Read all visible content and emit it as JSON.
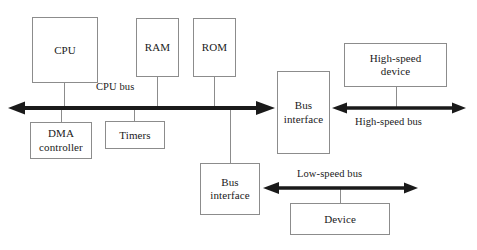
{
  "diagram": {
    "stroke_color": "#8c8c8c",
    "bus_color": "#1a1a1a",
    "text_color": "#1a1a1a",
    "background": "#ffffff"
  },
  "blocks": {
    "cpu": {
      "label": "CPU"
    },
    "ram": {
      "label": "RAM"
    },
    "rom": {
      "label": "ROM"
    },
    "dma_controller": {
      "label": "DMA\ncontroller"
    },
    "timers": {
      "label": "Timers"
    },
    "bus_interface_high": {
      "label": "Bus\ninterface"
    },
    "bus_interface_low": {
      "label": "Bus\ninterface"
    },
    "high_speed_device": {
      "label": "High-speed\ndevice"
    },
    "device": {
      "label": "Device"
    }
  },
  "buses": {
    "cpu_bus": {
      "label": "CPU bus"
    },
    "high_speed_bus": {
      "label": "High-speed bus"
    },
    "low_speed_bus": {
      "label": "Low-speed bus"
    }
  }
}
